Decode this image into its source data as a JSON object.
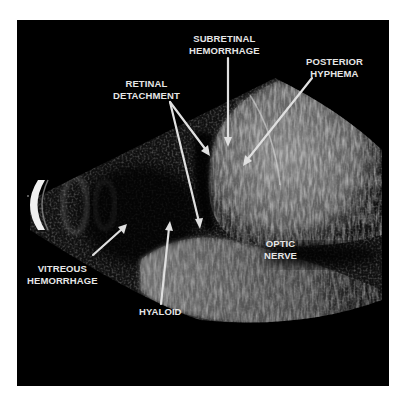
{
  "figure": {
    "type": "ocular B-scan ultrasound",
    "background_color": "#000000",
    "label_color": "#e6e6e6",
    "arrow_color": "#e0e0e0"
  },
  "labels": {
    "subretinal_hemorrhage": {
      "line1": "SUBRETINAL",
      "line2": "HEMORRHAGE"
    },
    "posterior_hyphema": {
      "line1": "POSTERIOR",
      "line2": "HYPHEMA"
    },
    "retinal_detachment": {
      "line1": "RETINAL",
      "line2": "DETACHMENT"
    },
    "vitreous_hemorrhage": {
      "line1": "VITREOUS",
      "line2": "HEMORRHAGE"
    },
    "hyaloid": {
      "line1": "HYALOID"
    },
    "optic_nerve": {
      "line1": "OPTIC",
      "line2": "NERVE"
    }
  },
  "arrows": [
    {
      "name": "subretinal-hemorrhage-arrow",
      "from": [
        228,
        58
      ],
      "to": [
        228,
        145
      ]
    },
    {
      "name": "posterior-hyphema-arrow",
      "from": [
        312,
        78
      ],
      "to": [
        243,
        165
      ]
    },
    {
      "name": "retinal-detachment-arrow-upper",
      "from": [
        170,
        102
      ],
      "to": [
        210,
        155
      ]
    },
    {
      "name": "retinal-detachment-arrow-lower",
      "from": [
        170,
        102
      ],
      "to": [
        200,
        228
      ]
    },
    {
      "name": "vitreous-hemorrhage-arrow",
      "from": [
        93,
        255
      ],
      "to": [
        126,
        225
      ]
    },
    {
      "name": "hyaloid-arrow",
      "from": [
        161,
        304
      ],
      "to": [
        170,
        222
      ]
    }
  ]
}
